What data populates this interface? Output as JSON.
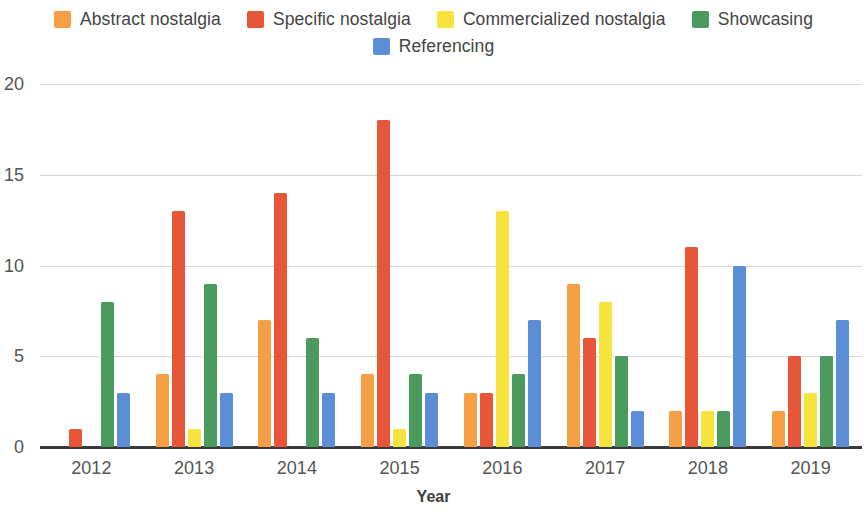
{
  "chart_data": {
    "type": "bar",
    "title": "",
    "xlabel": "Year",
    "ylabel": "",
    "categories": [
      "2012",
      "2013",
      "2014",
      "2015",
      "2016",
      "2017",
      "2018",
      "2019"
    ],
    "ylim": [
      0,
      20
    ],
    "yticks": [
      0,
      5,
      10,
      15,
      20
    ],
    "grid": true,
    "legend_position": "top",
    "series": [
      {
        "name": "Abstract nostalgia",
        "color": "#F6A046",
        "values": [
          0,
          4,
          7,
          4,
          3,
          9,
          2,
          2
        ]
      },
      {
        "name": "Specific nostalgia",
        "color": "#E8563A",
        "values": [
          1,
          13,
          14,
          18,
          3,
          6,
          11,
          5
        ]
      },
      {
        "name": "Commercialized nostalgia",
        "color": "#F7E33D",
        "values": [
          0,
          1,
          0,
          1,
          13,
          8,
          2,
          3
        ]
      },
      {
        "name": "Showcasing",
        "color": "#4B9B5F",
        "values": [
          8,
          9,
          6,
          4,
          4,
          5,
          2,
          5
        ]
      },
      {
        "name": "Referencing",
        "color": "#5B8ED6",
        "values": [
          3,
          3,
          3,
          3,
          7,
          2,
          10,
          7
        ]
      }
    ]
  },
  "legend": {
    "row1": [
      {
        "label": "Abstract nostalgia",
        "color": "#F6A046"
      },
      {
        "label": "Specific nostalgia",
        "color": "#E8563A"
      },
      {
        "label": "Commercialized nostalgia",
        "color": "#F7E33D"
      },
      {
        "label": "Showcasing",
        "color": "#4B9B5F"
      }
    ],
    "row2": [
      {
        "label": "Referencing",
        "color": "#5B8ED6"
      }
    ]
  },
  "axes": {
    "x_title": "Year",
    "y_tick_labels": [
      "20",
      "15",
      "10",
      "5",
      "0"
    ],
    "x_tick_labels": [
      "2012",
      "2013",
      "2014",
      "2015",
      "2016",
      "2017",
      "2018",
      "2019"
    ]
  }
}
